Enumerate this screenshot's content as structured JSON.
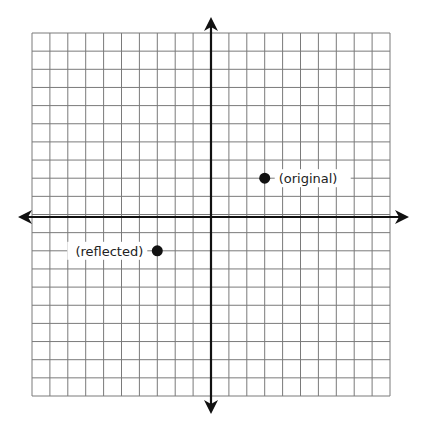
{
  "diagram": {
    "type": "coordinate-plane",
    "grid": {
      "cells_x": 20,
      "cells_y": 20,
      "range_x": [
        -10,
        10
      ],
      "range_y": [
        -10,
        10
      ]
    },
    "colors": {
      "grid": "#7a7a7a",
      "axis": "#111111",
      "point": "#111111",
      "background": "#ffffff"
    },
    "points": [
      {
        "id": "original",
        "x": 3,
        "y": 2,
        "label": "(original)",
        "label_side": "right"
      },
      {
        "id": "reflected",
        "x": -3,
        "y": -2,
        "label": "(reflected)",
        "label_side": "left"
      }
    ]
  }
}
